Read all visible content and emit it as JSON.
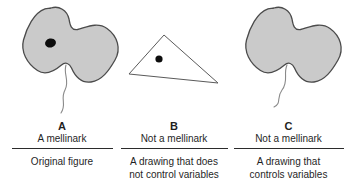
{
  "panels": [
    {
      "letter": "A",
      "caption": "A mellinark",
      "description": "Original figure",
      "figure": "gray blob with dot and tail (mellinark)"
    },
    {
      "letter": "B",
      "caption": "Not a mellinark",
      "description": "A drawing that does\nnot control variables",
      "figure": "triangle with dot, no tail"
    },
    {
      "letter": "C",
      "caption": "Not a mellinark",
      "description": "A drawing that\ncontrols variables",
      "figure": "gray blob with tail, no dot"
    }
  ],
  "colors": {
    "background": "#ffffff",
    "text": "#1f1f1f",
    "divider": "#2b2b2b",
    "blob_fill": "#cacaca",
    "blob_outline": "#4b4b4b",
    "dot": "#0d0d0d",
    "triangle_fill": "#ffffff",
    "triangle_outline": "#5a5a5a",
    "tail": "#8a8a8a"
  }
}
